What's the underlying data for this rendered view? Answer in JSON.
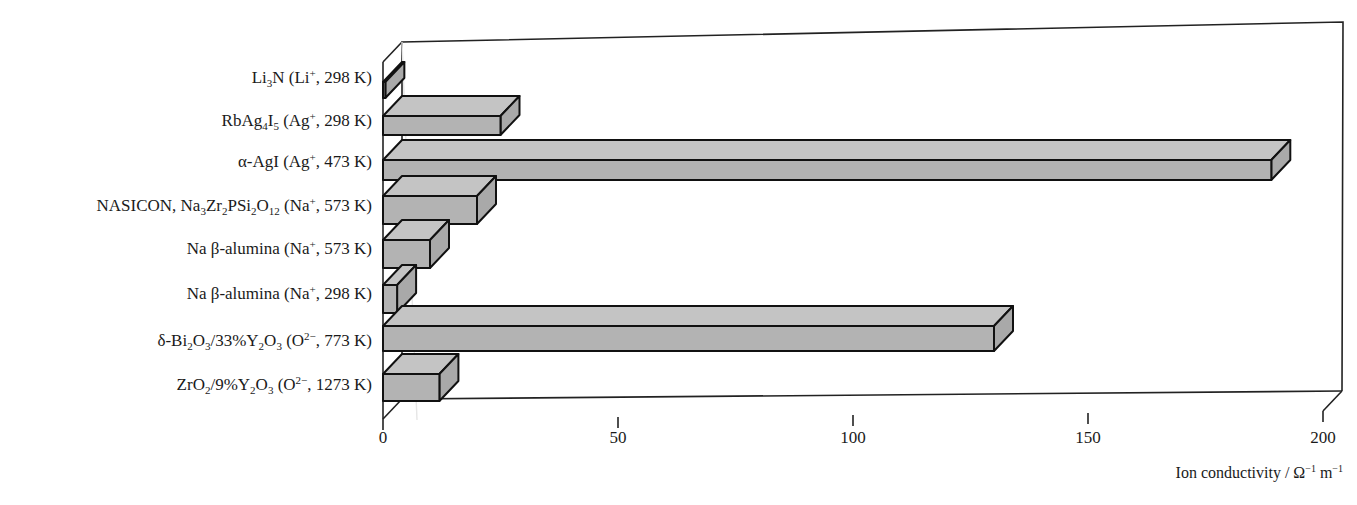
{
  "chart_data": {
    "type": "bar",
    "orientation": "horizontal",
    "style": "3d",
    "title": "",
    "xlabel": "Ion conductivity / Ω⁻¹ m⁻¹",
    "ylabel": "",
    "xlim": [
      0,
      200
    ],
    "xticks": [
      0,
      50,
      100,
      150,
      200
    ],
    "grid": false,
    "legend": null,
    "categories": [
      "Li3N (Li+, 298 K)",
      "RbAg4I5 (Ag+, 298 K)",
      "α-AgI (Ag+, 473 K)",
      "NASICON, Na3Zr2PSi2O12 (Na+, 573 K)",
      "Na β-alumina (Na+, 573 K)",
      "Na β-alumina (Na+, 298 K)",
      "δ-Bi2O3/33%Y2O3 (O2−, 773 K)",
      "ZrO2/9%Y2O3 (O2−, 1273 K)"
    ],
    "values": [
      0.5,
      25,
      189,
      20,
      10,
      3,
      130,
      12
    ],
    "bar_color": "#b3b3b3"
  },
  "labels": {
    "cat0": {
      "pre": "Li",
      "s1": "3",
      "mid": "N (Li",
      "sup": "+",
      "post": ", 298 K)"
    },
    "cat1": {
      "pre": "RbAg",
      "s1": "4",
      "mid1": "I",
      "s2": "5",
      "mid": " (Ag",
      "sup": "+",
      "post": ", 298 K)"
    },
    "cat2": {
      "pre": "α-AgI (Ag",
      "sup": "+",
      "post": ", 473 K)"
    },
    "cat3": {
      "pre": "NASICON, Na",
      "s1": "3",
      "m1": "Zr",
      "s2": "2",
      "m2": "PSi",
      "s3": "2",
      "m3": "O",
      "s4": "12",
      "mid": " (Na",
      "sup": "+",
      "post": ", 573 K)"
    },
    "cat4": {
      "pre": "Na β-alumina (Na",
      "sup": "+",
      "post": ", 573 K)"
    },
    "cat5": {
      "pre": "Na β-alumina (Na",
      "sup": "+",
      "post": ", 298 K)"
    },
    "cat6": {
      "pre": "δ-Bi",
      "s1": "2",
      "m1": "O",
      "s2": "3",
      "m2": "/33%Y",
      "s3": "2",
      "m3": "O",
      "s4": "3",
      "mid": " (O",
      "sup": "2−",
      "post": ", 773 K)"
    },
    "cat7": {
      "pre": "ZrO",
      "s1": "2",
      "m1": "/9%Y",
      "s2": "2",
      "m2": "O",
      "s3": "3",
      "mid": " (O",
      "sup": "2−",
      "post": ", 1273 K)"
    }
  },
  "ticks": [
    "0",
    "50",
    "100",
    "150",
    "200"
  ],
  "axis_title": {
    "text": "Ion conductivity / Ω",
    "sup1": "−1",
    "mid": " m",
    "sup2": "−1"
  }
}
